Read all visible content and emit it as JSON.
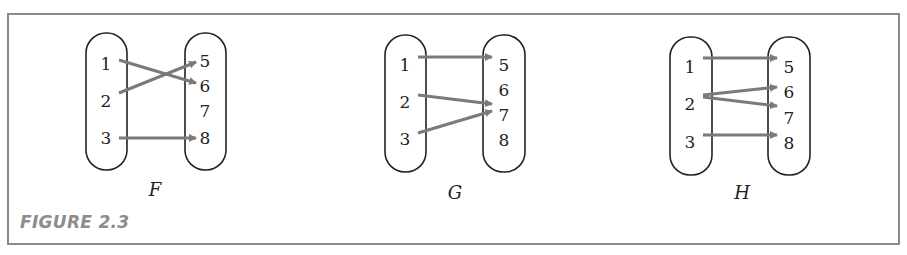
{
  "figure": {
    "label": "FIGURE 2.3",
    "border_color": "#8a8a8a",
    "arrow_color": "#7a7a7a"
  },
  "diagrams": [
    {
      "name": "F",
      "domain": [
        "1",
        "2",
        "3"
      ],
      "codomain": [
        "5",
        "6",
        "7",
        "8"
      ],
      "mappings": [
        [
          "1",
          "6"
        ],
        [
          "2",
          "5"
        ],
        [
          "3",
          "8"
        ]
      ]
    },
    {
      "name": "G",
      "domain": [
        "1",
        "2",
        "3"
      ],
      "codomain": [
        "5",
        "6",
        "7",
        "8"
      ],
      "mappings": [
        [
          "1",
          "5"
        ],
        [
          "2",
          "7"
        ],
        [
          "3",
          "7"
        ]
      ]
    },
    {
      "name": "H",
      "domain": [
        "1",
        "2",
        "3"
      ],
      "codomain": [
        "5",
        "6",
        "7",
        "8"
      ],
      "mappings": [
        [
          "1",
          "5"
        ],
        [
          "2",
          "6"
        ],
        [
          "2",
          "7"
        ],
        [
          "3",
          "8"
        ]
      ]
    }
  ]
}
